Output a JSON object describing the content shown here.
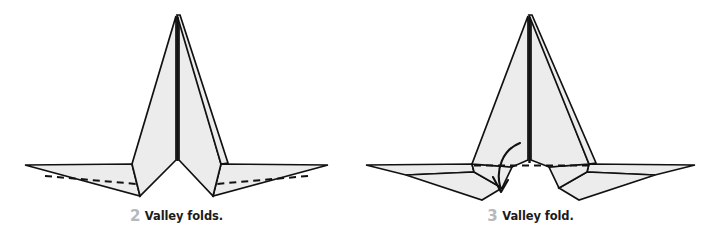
{
  "document": {
    "type": "origami-folding-instructions",
    "background_color": "#ffffff",
    "paper_fill_color": "#ececed",
    "paper_fill_dark_color": "#e2e3e4",
    "line_color": "#111111",
    "crease_line_color": "#111111",
    "caption_number_color": "#b6b8ba",
    "caption_text_color": "#1b1b1b"
  },
  "steps": [
    {
      "number": "2",
      "caption": "Valley folds.",
      "figure_name": "origami-figure-step-2",
      "description": "Folded paper model seen from the front: a tall central double-peaked spike flanked by two long thin horizontal wings, each wing marked with a dashed valley-fold line.",
      "markings": {
        "dashed_lines": 2,
        "arrows": 0
      }
    },
    {
      "number": "3",
      "caption": "Valley fold.",
      "figure_name": "origami-figure-step-3",
      "description": "Same model after the wing valley folds, with lower flaps folded down and a single horizontal dashed valley-fold line across the body, plus a curved arrow pointing downward indicating the next fold direction.",
      "markings": {
        "dashed_lines": 1,
        "arrows": 1,
        "arrow_name": "fold-direction-arrow",
        "arrow_direction": "down"
      }
    }
  ]
}
